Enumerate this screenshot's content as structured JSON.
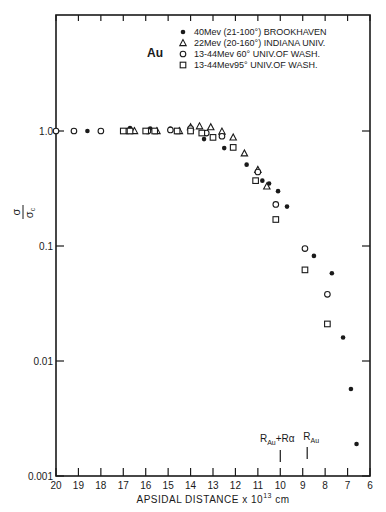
{
  "chart_data": {
    "type": "scatter",
    "title": "Au",
    "xlabel": "APSIDAL DISTANCE x10^13 cm",
    "ylabel": "σ/σc",
    "x_range": [
      20,
      6
    ],
    "x_reversed": true,
    "y_scale": "log",
    "ylim": [
      0.001,
      3.0
    ],
    "x_ticks": [
      "20",
      "19",
      "18",
      "17",
      "16",
      "15",
      "14",
      "13",
      "12",
      "11",
      "10",
      "9",
      "8",
      "7",
      "6"
    ],
    "y_ticks": [
      {
        "value": 1.0,
        "label": "1.0"
      },
      {
        "value": 0.1,
        "label": "0.1"
      },
      {
        "value": 0.01,
        "label": "0.01"
      },
      {
        "value": 0.001,
        "label": "0.001"
      }
    ],
    "grid": false,
    "legend_position": "upper right",
    "annotations": [
      {
        "text": "R_Au+Rα",
        "x": 10.0
      },
      {
        "text": "R_Au",
        "x": 8.8
      }
    ],
    "series": [
      {
        "name": "40Mev (21-100°) BROOKHAVEN",
        "marker": "filled-circle",
        "points": [
          [
            18.6,
            1.0
          ],
          [
            16.7,
            1.06
          ],
          [
            15.8,
            1.05
          ],
          [
            14.9,
            1.05
          ],
          [
            13.4,
            0.85
          ],
          [
            12.5,
            0.71
          ],
          [
            11.5,
            0.51
          ],
          [
            10.8,
            0.37
          ],
          [
            10.5,
            0.35
          ],
          [
            10.1,
            0.3
          ],
          [
            9.7,
            0.22
          ],
          [
            8.5,
            0.082
          ],
          [
            7.7,
            0.058
          ],
          [
            7.2,
            0.016
          ],
          [
            6.85,
            0.0057
          ],
          [
            6.6,
            0.0019
          ]
        ]
      },
      {
        "name": "22Mev (20-160°) INDIANA UNIV.",
        "marker": "triangle",
        "points": [
          [
            16.5,
            1.0
          ],
          [
            15.5,
            1.0
          ],
          [
            14.5,
            1.0
          ],
          [
            14.0,
            1.08
          ],
          [
            13.6,
            1.1
          ],
          [
            13.1,
            1.08
          ],
          [
            12.6,
            0.99
          ],
          [
            12.1,
            0.88
          ],
          [
            11.6,
            0.64
          ],
          [
            11.0,
            0.46
          ],
          [
            10.6,
            0.33
          ]
        ]
      },
      {
        "name": "13-44Mev 60° UNIV.OF WASH.",
        "marker": "open-circle",
        "points": [
          [
            20.0,
            1.0
          ],
          [
            19.2,
            1.0
          ],
          [
            18.0,
            1.0
          ],
          [
            16.8,
            1.0
          ],
          [
            15.9,
            1.0
          ],
          [
            14.9,
            1.02
          ],
          [
            14.0,
            1.05
          ],
          [
            13.3,
            0.96
          ],
          [
            12.6,
            0.9
          ],
          [
            11.0,
            0.44
          ],
          [
            10.2,
            0.23
          ],
          [
            8.9,
            0.095
          ],
          [
            7.9,
            0.038
          ]
        ]
      },
      {
        "name": "13-44Mev95° UNIV.OF WASH.",
        "marker": "open-square",
        "points": [
          [
            17.0,
            1.0
          ],
          [
            16.7,
            1.0
          ],
          [
            16.0,
            1.0
          ],
          [
            15.6,
            1.0
          ],
          [
            14.6,
            1.0
          ],
          [
            14.0,
            1.0
          ],
          [
            13.5,
            0.96
          ],
          [
            13.0,
            0.88
          ],
          [
            12.1,
            0.72
          ],
          [
            11.1,
            0.37
          ],
          [
            10.2,
            0.17
          ],
          [
            8.9,
            0.062
          ],
          [
            7.9,
            0.021
          ]
        ]
      }
    ]
  },
  "labels": {
    "title": "Au",
    "xlabel": "APSIDAL DISTANCE x 10",
    "xlabel_exp": "13",
    "xlabel_unit": " cm",
    "ylabel_num": "σ",
    "ylabel_den": "σ",
    "ylabel_den_sub": "c",
    "annot1_main": "R",
    "annot1_sub": "Au",
    "annot1_rest": "+Rα",
    "annot2_main": "R",
    "annot2_sub": "Au"
  }
}
